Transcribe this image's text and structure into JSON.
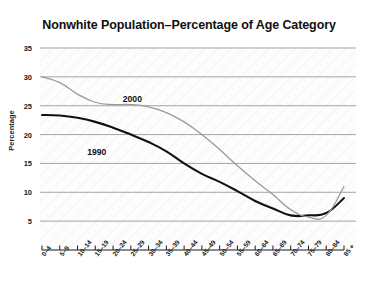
{
  "chart_data": {
    "type": "line",
    "title": "Nonwhite Population–Percentage of Age Category",
    "xlabel": "",
    "ylabel": "Percentage",
    "categories": [
      "0–4",
      "5–9",
      "10–14",
      "15–19",
      "20–24",
      "25–29",
      "30–34",
      "35–39",
      "40–44",
      "45–49",
      "50–54",
      "55–59",
      "60–64",
      "65–69",
      "70–74",
      "75–79",
      "80–84",
      "85 +"
    ],
    "yticks": [
      5,
      10,
      15,
      20,
      25,
      30,
      35
    ],
    "ylim": [
      0,
      35
    ],
    "grid": "horizontal",
    "legend_position": "inline-annotations",
    "series": [
      {
        "name": "1990",
        "color": "#111111",
        "values": [
          23.4,
          23.3,
          22.9,
          22.2,
          21.2,
          20.0,
          18.7,
          17.1,
          15.0,
          13.2,
          11.8,
          10.2,
          8.5,
          7.2,
          6.0,
          6.0,
          6.4,
          9.0
        ],
        "label_x_category": "15–19",
        "label_value": 16.6
      },
      {
        "name": "2000",
        "color": "#9a9a9a",
        "values": [
          30.0,
          29.0,
          27.0,
          25.6,
          25.2,
          25.2,
          24.8,
          23.8,
          22.2,
          20.0,
          17.4,
          14.6,
          12.0,
          9.6,
          7.0,
          5.7,
          6.0,
          11.0
        ],
        "label_x_category": "25–29",
        "label_value": 25.8
      }
    ]
  },
  "axis": {
    "ytick_labels": [
      "5",
      "10",
      "15",
      "20",
      "25",
      "30",
      "35"
    ]
  }
}
